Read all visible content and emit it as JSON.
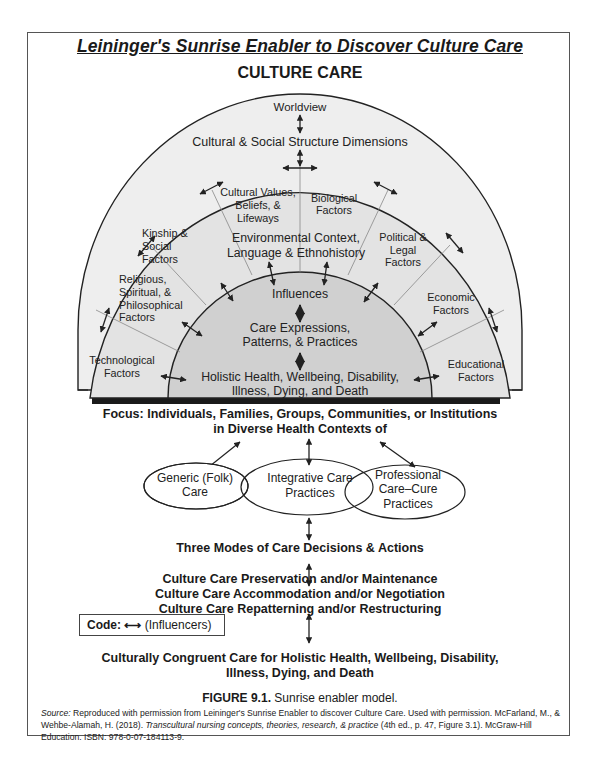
{
  "header": {
    "title": "Leininger's Sunrise Enabler to Discover Culture Care",
    "subtitle": "CULTURE CARE"
  },
  "sunrise": {
    "outer_ring": {
      "top_label": "Worldview",
      "second_label": "Cultural & Social Structure Dimensions"
    },
    "factors": [
      {
        "lines": [
          "Cultural Values,",
          "Beliefs, &",
          "Lifeways"
        ]
      },
      {
        "lines": [
          "Biological",
          "Factors"
        ]
      },
      {
        "lines": [
          "Kinship &",
          "Social",
          "Factors"
        ]
      },
      {
        "lines": [
          "Political &",
          "Legal",
          "Factors"
        ]
      },
      {
        "lines": [
          "Religious,",
          "Spiritual, &",
          "Philosophical",
          "Factors"
        ]
      },
      {
        "lines": [
          "Economic",
          "Factors"
        ]
      },
      {
        "lines": [
          "Technological",
          "Factors"
        ]
      },
      {
        "lines": [
          "Educational",
          "Factors"
        ]
      }
    ],
    "environment": [
      "Environmental Context,",
      "Language & Ethnohistory"
    ],
    "inner": {
      "influences": "Influences",
      "care_expressions": [
        "Care Expressions,",
        "Patterns, & Practices"
      ],
      "holistic": [
        "Holistic Health, Wellbeing, Disability,",
        "Illness, Dying, and Death"
      ]
    },
    "colors": {
      "outer_fill": "#eeeeee",
      "middle_fill": "#e2e2e2",
      "inner_fill": "#cfcfcf",
      "stroke": "#222222",
      "shadow": "#1a1a1a"
    }
  },
  "focus": {
    "line1": "Focus:  Individuals, Families, Groups, Communities, or Institutions",
    "line2": "in Diverse Health Contexts of"
  },
  "care_systems": [
    {
      "lines": [
        "Generic (Folk)",
        "Care"
      ]
    },
    {
      "lines": [
        "Integrative Care",
        "Practices"
      ]
    },
    {
      "lines": [
        "Professional",
        "Care–Cure",
        "Practices"
      ]
    }
  ],
  "modes": {
    "heading": "Three Modes of Care Decisions & Actions",
    "items": [
      "Culture Care Preservation and/or Maintenance",
      "Culture Care Accommodation and/or Negotiation",
      "Culture Care Repatterning and/or Restructuring"
    ]
  },
  "code_legend": {
    "label": "Code:",
    "symbol": "⟷",
    "meaning": "(Influencers)"
  },
  "outcome": {
    "line1": "Culturally Congruent Care for Holistic Health, Wellbeing, Disability,",
    "line2": "Illness, Dying, and Death"
  },
  "caption": {
    "figure_label": "FIGURE 9.1.",
    "figure_text": " Sunrise enabler model.",
    "source_label": "Source:",
    "source_text_1": " Reproduced with permission from Leininger's Sunrise Enabler to discover Culture Care. Used with permission. McFarland, M., & Wehbe-Alamah, H. (2018). ",
    "source_book": "Transcultural nursing concepts, theories, research, & practice",
    "source_text_2": " (4th ed., p. 47, Figure 3.1). McGraw-Hill Education. ISBN: 978-0-07-184113-9."
  }
}
